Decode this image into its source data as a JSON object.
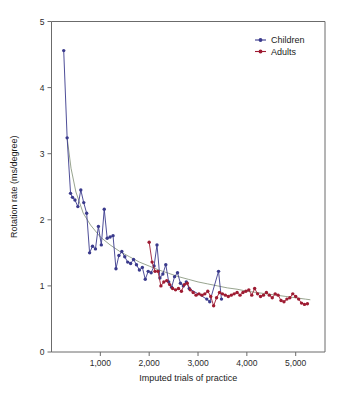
{
  "chart_data": {
    "type": "line",
    "title": "",
    "subtitle": "",
    "xlabel": "Imputed trials of practice",
    "ylabel": "Rotation rate (ms/degree)",
    "xlim": [
      0,
      5600
    ],
    "ylim": [
      0,
      5
    ],
    "xticks": [
      1000,
      2000,
      3000,
      4000,
      5000
    ],
    "xtick_labels": [
      "1,000",
      "2,000",
      "3,000",
      "4,000",
      "5,000"
    ],
    "yticks": [
      0,
      1,
      2,
      3,
      4,
      5
    ],
    "ytick_labels": [
      "0",
      "1",
      "2",
      "3",
      "4",
      "5"
    ],
    "grid": false,
    "legend_position": "top-right",
    "colors": {
      "children": "#3a3a8c",
      "adults": "#9e1b32",
      "trend": "#8c9a82",
      "axis": "#6b6b6b",
      "text": "#1a1a1a",
      "background": "#ffffff"
    },
    "series": [
      {
        "name": "Children",
        "color": "#3a3a8c",
        "marker": "circle",
        "x": [
          250,
          320,
          390,
          430,
          480,
          540,
          600,
          660,
          720,
          780,
          840,
          900,
          960,
          1020,
          1080,
          1140,
          1200,
          1260,
          1320,
          1380,
          1440,
          1500,
          1560,
          1620,
          1680,
          1740,
          1800,
          1860,
          1920,
          1980,
          2040,
          2100,
          2160,
          2220,
          2280,
          2340,
          2400,
          2460,
          2520,
          2580,
          2640,
          2700,
          2760,
          2820,
          3180,
          3240,
          3420,
          3480
        ],
        "y": [
          4.56,
          3.24,
          2.4,
          2.34,
          2.3,
          2.2,
          2.45,
          2.26,
          2.1,
          1.5,
          1.6,
          1.56,
          1.9,
          1.62,
          2.16,
          1.72,
          1.74,
          1.76,
          1.26,
          1.46,
          1.52,
          1.44,
          1.36,
          1.34,
          1.4,
          1.32,
          1.24,
          1.28,
          1.1,
          1.22,
          1.2,
          1.3,
          1.62,
          1.12,
          1.18,
          1.32,
          1.06,
          0.98,
          1.14,
          1.2,
          1.04,
          1.0,
          1.06,
          0.96,
          0.8,
          0.76,
          1.22,
          0.8
        ]
      },
      {
        "name": "Adults",
        "color": "#9e1b32",
        "marker": "circle",
        "x": [
          2000,
          2060,
          2120,
          2180,
          2240,
          2300,
          2360,
          2420,
          2480,
          2540,
          2600,
          2660,
          2720,
          2780,
          2840,
          2900,
          2960,
          3020,
          3080,
          3140,
          3200,
          3260,
          3320,
          3380,
          3440,
          3500,
          3560,
          3620,
          3680,
          3740,
          3800,
          3860,
          3920,
          3980,
          4040,
          4100,
          4160,
          4220,
          4280,
          4340,
          4400,
          4460,
          4520,
          4580,
          4640,
          4700,
          4760,
          4820,
          4880,
          4940,
          5000,
          5060,
          5120,
          5180,
          5240
        ],
        "y": [
          1.66,
          1.36,
          1.22,
          1.22,
          1.0,
          1.06,
          1.08,
          1.02,
          0.96,
          0.94,
          0.96,
          0.92,
          1.02,
          1.04,
          0.94,
          0.9,
          0.86,
          0.88,
          0.86,
          0.88,
          0.92,
          0.84,
          0.7,
          0.82,
          0.9,
          0.88,
          0.86,
          0.84,
          0.86,
          0.88,
          0.9,
          0.86,
          0.9,
          0.92,
          0.94,
          0.86,
          0.96,
          0.88,
          0.84,
          0.86,
          0.9,
          0.86,
          0.82,
          0.88,
          0.86,
          0.78,
          0.76,
          0.8,
          0.82,
          0.88,
          0.84,
          0.8,
          0.74,
          0.72,
          0.73
        ]
      }
    ],
    "trend": {
      "name": "fitted power-law curve",
      "color": "#8c9a82",
      "x": [
        320,
        400,
        500,
        650,
        800,
        1000,
        1200,
        1400,
        1600,
        1800,
        2000,
        2200,
        2400,
        2600,
        2800,
        3000,
        3200,
        3400,
        3600,
        3800,
        4000,
        4200,
        4400,
        4600,
        4800,
        5000,
        5200,
        5300
      ],
      "y": [
        3.24,
        2.78,
        2.42,
        2.1,
        1.92,
        1.74,
        1.62,
        1.52,
        1.44,
        1.36,
        1.3,
        1.24,
        1.19,
        1.14,
        1.1,
        1.06,
        1.03,
        1.0,
        0.97,
        0.95,
        0.92,
        0.9,
        0.88,
        0.86,
        0.84,
        0.82,
        0.8,
        0.79
      ]
    }
  },
  "legend": {
    "items": [
      {
        "label": "Children",
        "color": "#3a3a8c"
      },
      {
        "label": "Adults",
        "color": "#9e1b32"
      }
    ]
  }
}
